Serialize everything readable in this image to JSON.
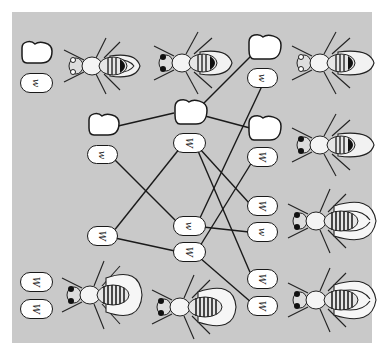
{
  "figure": {
    "background": "#c9c9c9",
    "line_color": "#1a1a1a",
    "alleles": {
      "wild_type": "W",
      "mutant": "w"
    }
  },
  "parents": {
    "female": {
      "chromosomes": [
        "Y",
        "w"
      ],
      "eye": "white"
    },
    "male": {
      "eye": "red"
    }
  },
  "gametes": {
    "column1": [
      {
        "type": "Y"
      },
      {
        "label": "w"
      },
      {
        "label": "W"
      }
    ],
    "column2": [
      {
        "type": "Y"
      },
      {
        "label": "W"
      },
      {
        "label": "w"
      },
      {
        "label": "W"
      }
    ]
  },
  "offspring": [
    {
      "chromosomes": [
        "Y",
        "w"
      ],
      "eye": "white"
    },
    {
      "chromosomes": [
        "Y",
        "W"
      ],
      "eye": "red"
    },
    {
      "chromosomes": [
        "W",
        "w"
      ],
      "eye": "red"
    },
    {
      "chromosomes": [
        "W",
        "W"
      ],
      "eye": "red"
    }
  ],
  "bottom_left": {
    "chromosomes": [
      "W",
      "W"
    ],
    "eye": "red"
  },
  "labels": {
    "p_female_x": "w",
    "col1_x1": "w",
    "col1_x2": "W",
    "col2_x1": "W",
    "col2_x2": "w",
    "col2_x3": "W",
    "off1_x": "w",
    "off2_x": "W",
    "off3_x1": "W",
    "off3_x2": "w",
    "off4_x1": "W",
    "off4_x2": "W",
    "bl_x1": "W",
    "bl_x2": "W"
  }
}
